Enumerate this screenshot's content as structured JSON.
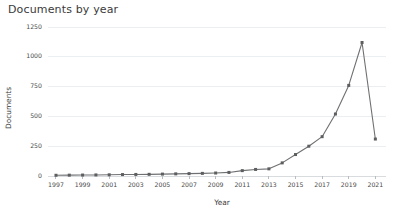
{
  "chart_data": {
    "type": "line",
    "title": "Documents by year",
    "xlabel": "Year",
    "ylabel": "Documents",
    "xlim": [
      1996.4,
      2021.8
    ],
    "ylim": [
      0,
      1250
    ],
    "grid": true,
    "legend": false,
    "x_tick_labels": [
      "1997",
      "1999",
      "2001",
      "2003",
      "2005",
      "2007",
      "2009",
      "2011",
      "2013",
      "2015",
      "2017",
      "2019",
      "2021"
    ],
    "y_tick_labels": [
      "0",
      "250",
      "500",
      "750",
      "1000",
      "1250"
    ],
    "y_ticks": [
      0,
      250,
      500,
      750,
      1000,
      1250
    ],
    "x_ticks": [
      1997,
      1999,
      2001,
      2003,
      2005,
      2007,
      2009,
      2011,
      2013,
      2015,
      2017,
      2019,
      2021
    ],
    "x": [
      1997,
      1998,
      1999,
      2000,
      2001,
      2002,
      2003,
      2004,
      2005,
      2006,
      2007,
      2008,
      2009,
      2010,
      2011,
      2012,
      2013,
      2014,
      2015,
      2016,
      2017,
      2018,
      2019,
      2020,
      2021
    ],
    "values": [
      6,
      7,
      8,
      9,
      10,
      12,
      13,
      14,
      16,
      18,
      20,
      22,
      25,
      30,
      45,
      55,
      60,
      110,
      180,
      250,
      330,
      520,
      760,
      1120,
      310
    ],
    "series": [
      {
        "name": "Documents",
        "color": "#6f7072",
        "marker": "square",
        "values": [
          6,
          7,
          8,
          9,
          10,
          12,
          13,
          14,
          16,
          18,
          20,
          22,
          25,
          30,
          45,
          55,
          60,
          110,
          180,
          250,
          330,
          520,
          760,
          1120,
          310
        ]
      }
    ]
  },
  "colors": {
    "line": "#6f7072",
    "marker": "#5d5e60",
    "grid": "#eceff1",
    "axis": "#d9dcde",
    "text": "#3c3c3c",
    "background": "#ffffff"
  }
}
